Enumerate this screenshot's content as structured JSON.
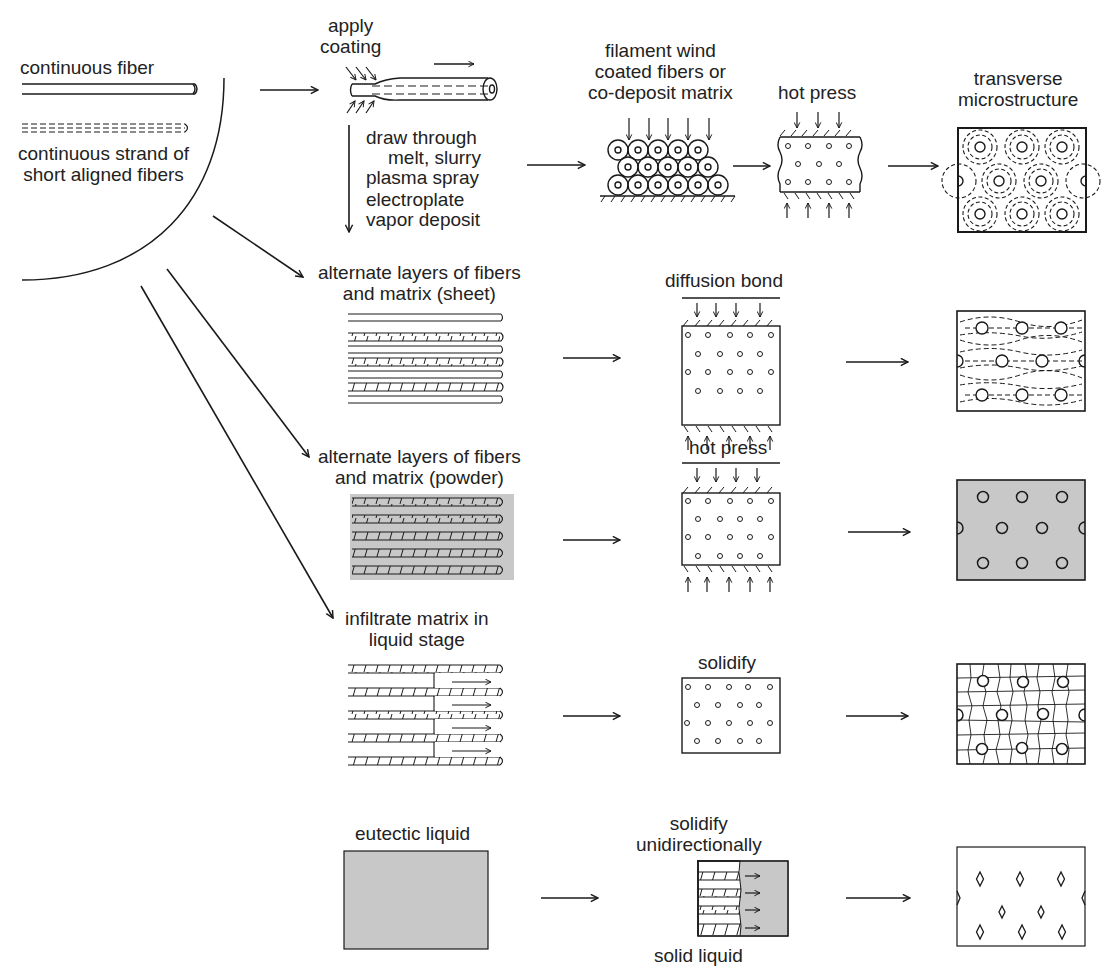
{
  "diagram": {
    "type": "process-flow",
    "source": {
      "fiber_forms": [
        {
          "label": "continuous fiber"
        },
        {
          "label_lines": [
            "continuous strand of",
            "short aligned fibers"
          ]
        }
      ]
    },
    "coating": {
      "title_lines": [
        "apply",
        "coating"
      ],
      "methods": [
        "draw through",
        "melt, slurry",
        "plasma spray",
        "electroplate",
        "vapor deposit"
      ]
    },
    "routes": [
      {
        "id": "filament-wind",
        "input_label_lines": [
          "filament wind",
          "coated fibers or",
          "co-deposit matrix"
        ],
        "process_label": "hot press",
        "result_label_lines": [
          "transverse",
          "microstructure"
        ],
        "result": "fibers with dashed reaction-zone rings"
      },
      {
        "id": "sheet",
        "input_label_lines": [
          "alternate layers of fibers",
          "and matrix (sheet)"
        ],
        "process_label": "diffusion bond",
        "result": "fibers in banded layers"
      },
      {
        "id": "powder",
        "input_label_lines": [
          "alternate layers of fibers",
          "and matrix (powder)"
        ],
        "process_label": "hot press",
        "result": "fibers in gray matrix"
      },
      {
        "id": "liquid-infiltration",
        "input_label_lines": [
          "infiltrate matrix in",
          "liquid stage"
        ],
        "process_label": "solidify",
        "result": "fibers in grain structure"
      },
      {
        "id": "eutectic",
        "input_label": "eutectic liquid",
        "process_label_lines": [
          "solidify",
          "unidirectionally"
        ],
        "process_sublabel": "solid liquid",
        "result": "diamond-shaped in-situ fibers"
      }
    ],
    "colors": {
      "line": "#1a1a1a",
      "matrix_gray": "#c8c8c8",
      "background": "#ffffff"
    }
  }
}
